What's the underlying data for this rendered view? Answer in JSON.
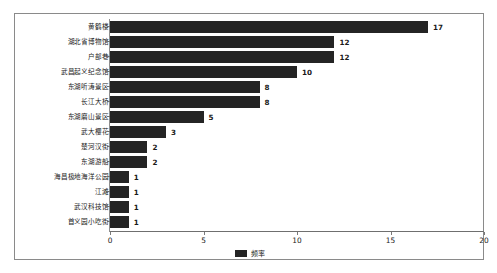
{
  "chart_data": {
    "type": "bar",
    "orientation": "horizontal",
    "title": "",
    "xlabel": "",
    "ylabel": "",
    "xlim": [
      0,
      20
    ],
    "xticks": [
      "0",
      "5",
      "10",
      "15",
      "20"
    ],
    "grid": false,
    "legend": {
      "position": "bottom",
      "entries": [
        "频率"
      ]
    },
    "series": [
      {
        "name": "频率",
        "color": "#242424",
        "values": [
          17,
          12,
          12,
          10,
          8,
          8,
          5,
          3,
          2,
          2,
          1,
          1,
          1,
          1
        ]
      }
    ],
    "categories": [
      "黄鹤楼",
      "湖北省博物馆",
      "户部巷",
      "武昌起义纪念馆",
      "东湖听涛景区",
      "长江大桥",
      "东湖磨山景区",
      "武大樱花",
      "楚河汉街",
      "东湖游船",
      "海昌极地海洋公园",
      "江滩",
      "武汉科技馆",
      "首义园小吃街"
    ],
    "data_labels": [
      "17",
      "12",
      "12",
      "10",
      "8",
      "8",
      "5",
      "3",
      "2",
      "2",
      "1",
      "1",
      "1",
      "1"
    ]
  }
}
